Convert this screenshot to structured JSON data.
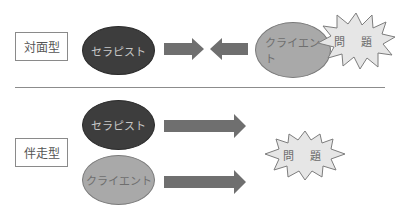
{
  "colors": {
    "therapist_fill": "#3d3d3d",
    "client_fill": "#a9a9a9",
    "arrow_fill": "#6f6f6f",
    "burst_fill": "#e6e6e6",
    "burst_stroke": "#7d7d7d",
    "divider": "#8c8c8c"
  },
  "face_to_face": {
    "label": "対面型",
    "therapist": "セラピスト",
    "client": "クライエント",
    "problem": "問 題",
    "arrows": [
      "right",
      "left"
    ]
  },
  "accompanying": {
    "label": "伴走型",
    "therapist": "セラピスト",
    "client": "クライエント",
    "problem": "問 題",
    "arrows": [
      "right",
      "right"
    ]
  }
}
